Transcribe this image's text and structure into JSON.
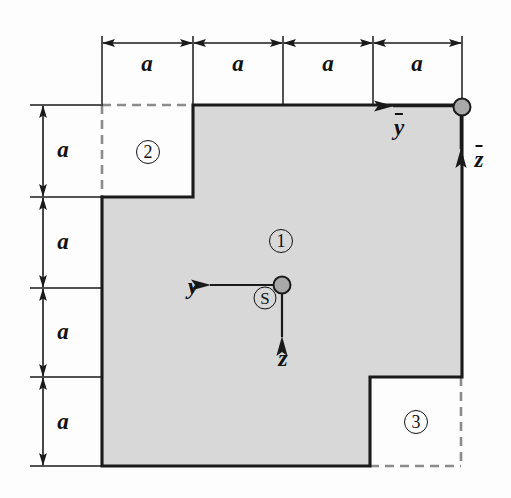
{
  "figure": {
    "canvas": {
      "width": 511,
      "height": 498
    },
    "colors": {
      "fill_gray": "#d8d8d8",
      "outline": "#1a1a1a",
      "dashed": "#8c8c8c",
      "dimension": "#1a1a1a",
      "dot_fill": "#a8a8a8",
      "background": "#fdfdfd"
    },
    "geometry": {
      "module_a_px": 90,
      "x_grid": [
        102,
        193,
        283,
        373,
        462
      ],
      "y_grid": [
        105,
        197,
        288,
        377,
        466
      ],
      "outer_rect": {
        "x0": 102,
        "y0": 105,
        "x1": 462,
        "y1": 466,
        "width_a": 4,
        "height_a": 4
      },
      "main_polygon": [
        [
          193,
          105
        ],
        [
          462,
          105
        ],
        [
          462,
          377
        ],
        [
          370,
          377
        ],
        [
          370,
          466
        ],
        [
          102,
          466
        ],
        [
          102,
          197
        ],
        [
          193,
          197
        ]
      ],
      "notch_top_left": {
        "x0": 102,
        "y0": 105,
        "x1": 193,
        "y1": 197,
        "width_a": 1,
        "height_a": 1
      },
      "notch_bottom_right": {
        "x0": 370,
        "y0": 377,
        "x1": 461,
        "y1": 466,
        "width_a": 1,
        "height_a": 1
      }
    }
  },
  "parts": [
    {
      "id": "part-1",
      "label": "①",
      "number": "1",
      "x": 281,
      "y": 241,
      "filled": true,
      "description": "main shaded L-shaped area"
    },
    {
      "id": "part-2",
      "label": "②",
      "number": "2",
      "x": 148,
      "y": 152,
      "filled": false,
      "description": "top-left cut-out square"
    },
    {
      "id": "part-3",
      "label": "③",
      "number": "3",
      "x": 416,
      "y": 422,
      "filled": false,
      "description": "bottom-right cut-out square"
    }
  ],
  "dimensions": {
    "top": {
      "orientation": "horizontal",
      "line_y": 43,
      "label": "a",
      "segments": [
        {
          "label": "a",
          "x_start": 102,
          "x_end": 193,
          "label_x": 147,
          "label_y": 64
        },
        {
          "label": "a",
          "x_start": 193,
          "x_end": 283,
          "label_x": 238,
          "label_y": 64
        },
        {
          "label": "a",
          "x_start": 283,
          "x_end": 373,
          "label_x": 328,
          "label_y": 64
        },
        {
          "label": "a",
          "x_start": 373,
          "x_end": 462,
          "label_x": 417,
          "label_y": 64
        }
      ]
    },
    "left": {
      "orientation": "vertical",
      "line_x": 43,
      "label": "a",
      "segments": [
        {
          "label": "a",
          "y_start": 105,
          "y_end": 197,
          "label_x": 63,
          "label_y": 150
        },
        {
          "label": "a",
          "y_start": 197,
          "y_end": 288,
          "label_x": 63,
          "label_y": 242
        },
        {
          "label": "a",
          "y_start": 288,
          "y_end": 377,
          "label_x": 63,
          "label_y": 332
        },
        {
          "label": "a",
          "y_start": 377,
          "y_end": 466,
          "label_x": 63,
          "label_y": 422
        }
      ]
    }
  },
  "axes": {
    "centroid": {
      "marker_label": "S",
      "marker_x": 265,
      "marker_y": 298,
      "origin_x": 282,
      "origin_y": 285,
      "horizontal": {
        "label": "y",
        "direction": "left",
        "tip_x": 207,
        "tip_y": 285,
        "label_x": 193,
        "label_y": 286
      },
      "vertical": {
        "label": "z",
        "direction": "down",
        "tip_x": 282,
        "tip_y": 340,
        "label_x": 283,
        "label_y": 358
      }
    },
    "reference": {
      "origin_x": 462,
      "origin_y": 107,
      "horizontal": {
        "label": "ȳ",
        "base": "y",
        "direction": "left",
        "tip_x": 390,
        "tip_y": 106,
        "label_x": 399,
        "label_y": 128
      },
      "vertical": {
        "label": "z̄",
        "base": "z",
        "direction": "down",
        "tip_x": 461,
        "tip_y": 152,
        "label_x": 479,
        "label_y": 160
      }
    }
  }
}
